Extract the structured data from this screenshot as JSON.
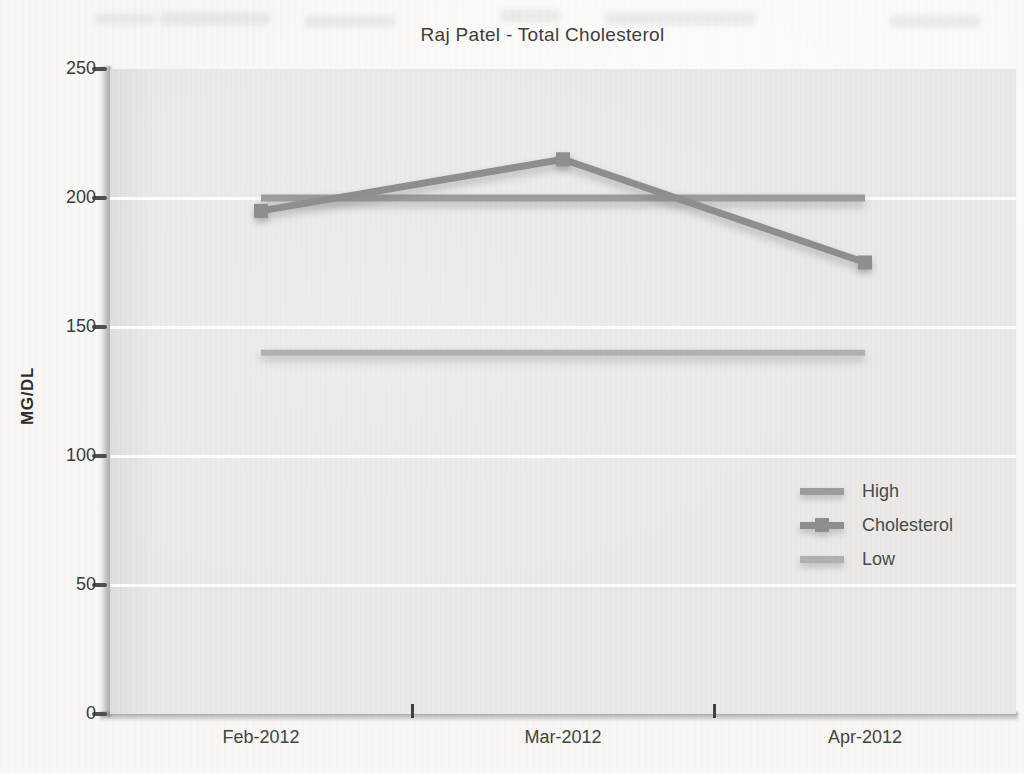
{
  "chart_data": {
    "type": "line",
    "title": "Raj Patel - Total Cholesterol",
    "xlabel": "",
    "ylabel": "MG/DL",
    "categories": [
      "Feb-2012",
      "Mar-2012",
      "Apr-2012"
    ],
    "series": [
      {
        "name": "High",
        "values": [
          200,
          200,
          200
        ],
        "color": "#9c9c9c",
        "marker": false
      },
      {
        "name": "Cholesterol",
        "values": [
          195,
          215,
          175
        ],
        "color": "#8e8e8e",
        "marker": true
      },
      {
        "name": "Low",
        "values": [
          140,
          140,
          140
        ],
        "color": "#b0b0af",
        "marker": false
      }
    ],
    "ylim": [
      0,
      250
    ],
    "yticks": [
      0,
      50,
      100,
      150,
      200,
      250
    ],
    "grid": "horizontal",
    "gridline_color": "#ffffff",
    "plot_background": "#eae9e7",
    "legend_position": "middle-right",
    "legend": [
      "High",
      "Cholesterol",
      "Low"
    ]
  }
}
